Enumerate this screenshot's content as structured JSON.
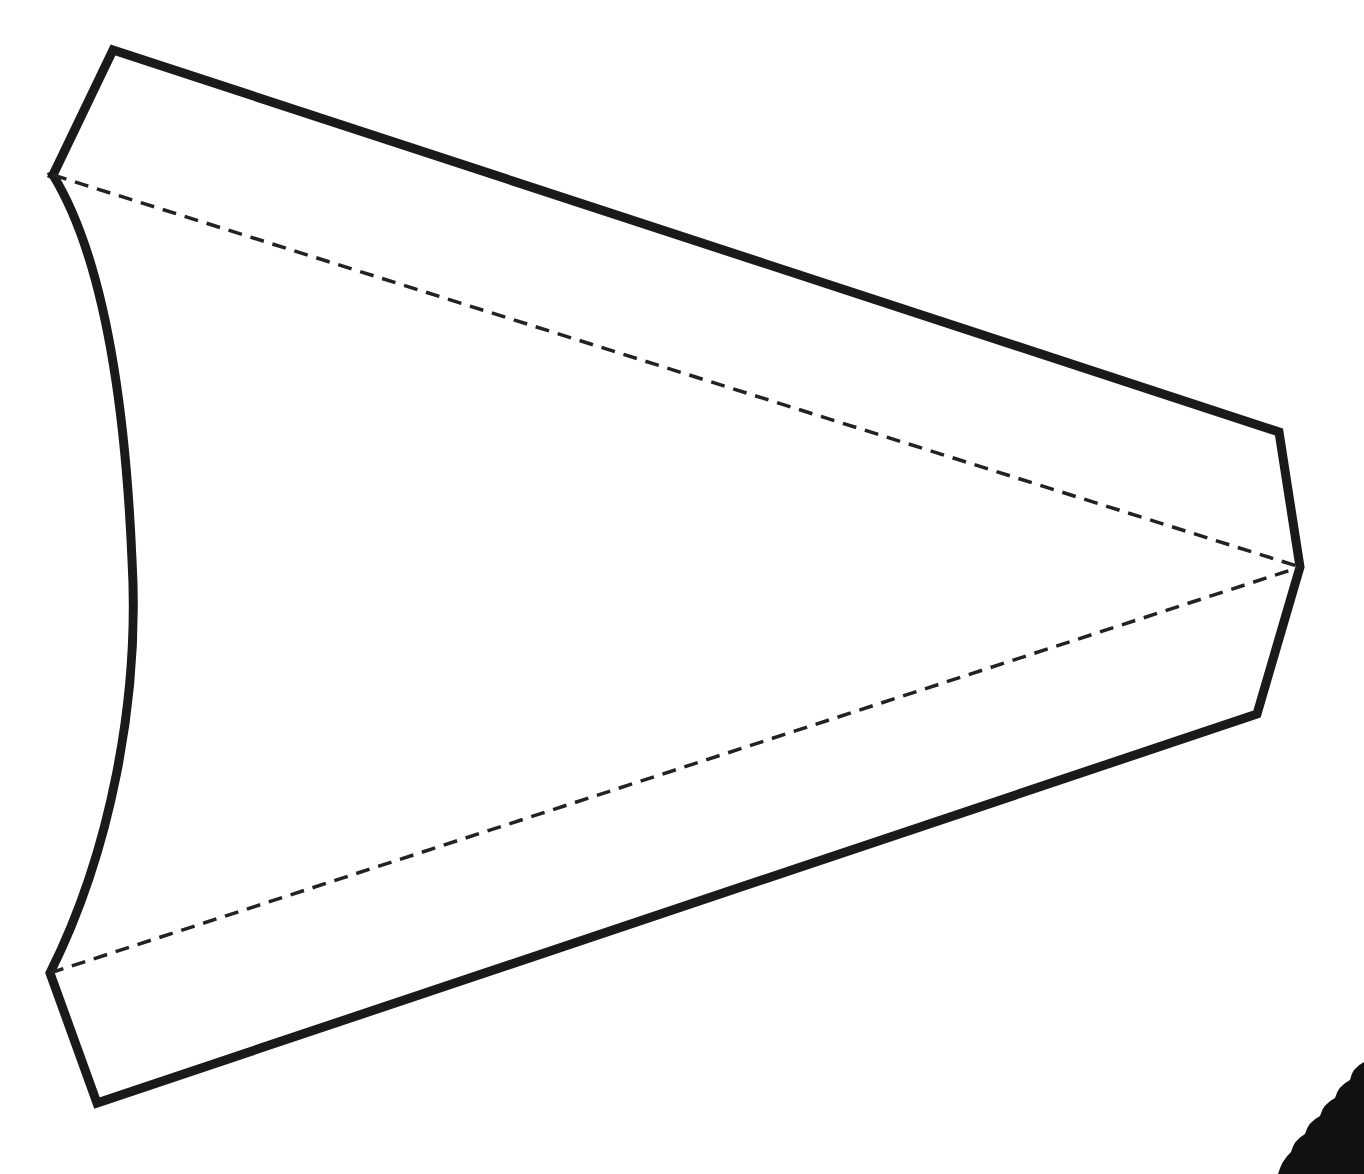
{
  "diagram": {
    "type": "folding-template",
    "colors": {
      "background": "#ffffff",
      "outline": "#1a1a1a",
      "fold_line": "#222222",
      "corner_shape": "#111111"
    },
    "outline": {
      "stroke_width": 9,
      "vertices": {
        "top_left": [
          113,
          50
        ],
        "left_upper": [
          53,
          175
        ],
        "top_right": [
          1279,
          432
        ],
        "right_apex": [
          1300,
          567
        ],
        "bottom_right": [
          1257,
          714
        ],
        "left_lower": [
          50,
          973
        ],
        "bottom_left": [
          97,
          1103
        ]
      },
      "curved_edge": {
        "from": [
          53,
          175
        ],
        "to": [
          50,
          973
        ],
        "max_bulge_x": 132
      }
    },
    "fold_lines": [
      {
        "name": "upper-fold-line",
        "from": [
          53,
          175
        ],
        "to": [
          1300,
          567
        ],
        "style": "dashed"
      },
      {
        "name": "lower-fold-line",
        "from": [
          50,
          973
        ],
        "to": [
          1300,
          567
        ],
        "style": "dashed"
      }
    ],
    "corner_artifact": {
      "position": "bottom-right",
      "shape": "scalloped-edge"
    }
  }
}
